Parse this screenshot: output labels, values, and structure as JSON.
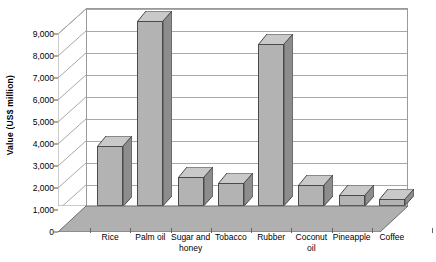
{
  "chart_data": {
    "type": "bar",
    "title": "",
    "xlabel": "",
    "ylabel": "Value (US$ million)",
    "categories": [
      "Rice",
      "Palm oil",
      "Sugar and honey",
      "Tobacco",
      "Rubber",
      "Coconut oil",
      "Pineapple",
      "Coffee"
    ],
    "values": [
      2750,
      8400,
      1300,
      1050,
      7350,
      950,
      500,
      300
    ],
    "ylim": [
      0,
      9000
    ],
    "ytick_labels": [
      "0",
      "1,000",
      "2,000",
      "3,000",
      "4,000",
      "5,000",
      "6,000",
      "7,000",
      "8,000",
      "9,000"
    ],
    "ytick_values": [
      0,
      1000,
      2000,
      3000,
      4000,
      5000,
      6000,
      7000,
      8000,
      9000
    ],
    "grid": true,
    "legend": "none",
    "style": "3d-column",
    "colors": {
      "bar_front": "#b3b3b3",
      "bar_side": "#8d8d8d",
      "bar_top": "#c9c9c9",
      "bar_outline": "#4a4a4a",
      "gridline": "#a8a8a8",
      "floor": "#b0b0b0",
      "axis": "#555555",
      "text": "#000000",
      "background": "#ffffff"
    }
  }
}
